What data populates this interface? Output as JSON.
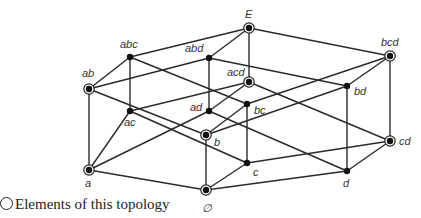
{
  "diagram": {
    "type": "hasse-diagram",
    "nodes": [
      {
        "id": "E",
        "label": "E",
        "x": 249,
        "y": 28,
        "in_topology": true,
        "lx": 245,
        "ly": 18
      },
      {
        "id": "abc",
        "label": "abc",
        "x": 130,
        "y": 57,
        "in_topology": false,
        "lx": 120,
        "ly": 48
      },
      {
        "id": "abd",
        "label": "abd",
        "x": 209,
        "y": 58,
        "in_topology": false,
        "lx": 185,
        "ly": 52
      },
      {
        "id": "bcd",
        "label": "bcd",
        "x": 390,
        "y": 56,
        "in_topology": true,
        "lx": 381,
        "ly": 46
      },
      {
        "id": "ab",
        "label": "ab",
        "x": 89,
        "y": 89,
        "in_topology": true,
        "lx": 82,
        "ly": 77
      },
      {
        "id": "acd",
        "label": "acd",
        "x": 249,
        "y": 82,
        "in_topology": true,
        "lx": 227,
        "ly": 76
      },
      {
        "id": "bd",
        "label": "bd",
        "x": 347,
        "y": 86,
        "in_topology": false,
        "lx": 354,
        "ly": 95
      },
      {
        "id": "ad",
        "label": "ad",
        "x": 209,
        "y": 111,
        "in_topology": false,
        "lx": 190,
        "ly": 111
      },
      {
        "id": "bc",
        "label": "bc",
        "x": 247,
        "y": 104,
        "in_topology": false,
        "lx": 254,
        "ly": 114
      },
      {
        "id": "ac",
        "label": "ac",
        "x": 130,
        "y": 111,
        "in_topology": false,
        "lx": 124,
        "ly": 126
      },
      {
        "id": "cd",
        "label": "cd",
        "x": 390,
        "y": 141,
        "in_topology": true,
        "lx": 399,
        "ly": 145
      },
      {
        "id": "a",
        "label": "a",
        "x": 89,
        "y": 170,
        "in_topology": true,
        "lx": 85,
        "ly": 187
      },
      {
        "id": "b",
        "label": "b",
        "x": 206,
        "y": 135,
        "in_topology": true,
        "lx": 214,
        "ly": 146
      },
      {
        "id": "d",
        "label": "d",
        "x": 347,
        "y": 171,
        "in_topology": false,
        "lx": 343,
        "ly": 187
      },
      {
        "id": "c",
        "label": "c",
        "x": 247,
        "y": 163,
        "in_topology": false,
        "lx": 253,
        "ly": 176
      },
      {
        "id": "empty",
        "label": "∅",
        "x": 206,
        "y": 190,
        "in_topology": true,
        "lx": 202,
        "ly": 212
      }
    ],
    "edges": [
      [
        "E",
        "abc"
      ],
      [
        "E",
        "abd"
      ],
      [
        "E",
        "acd"
      ],
      [
        "E",
        "bcd"
      ],
      [
        "abc",
        "ab"
      ],
      [
        "abc",
        "ac"
      ],
      [
        "abc",
        "bc"
      ],
      [
        "abd",
        "ab"
      ],
      [
        "abd",
        "ad"
      ],
      [
        "abd",
        "bd"
      ],
      [
        "acd",
        "ac"
      ],
      [
        "acd",
        "ad"
      ],
      [
        "acd",
        "cd"
      ],
      [
        "bcd",
        "bc"
      ],
      [
        "bcd",
        "bd"
      ],
      [
        "bcd",
        "cd"
      ],
      [
        "ab",
        "a"
      ],
      [
        "ab",
        "b"
      ],
      [
        "ac",
        "a"
      ],
      [
        "ac",
        "c"
      ],
      [
        "ad",
        "a"
      ],
      [
        "ad",
        "d"
      ],
      [
        "bc",
        "b"
      ],
      [
        "bc",
        "c"
      ],
      [
        "bd",
        "b"
      ],
      [
        "bd",
        "d"
      ],
      [
        "cd",
        "c"
      ],
      [
        "cd",
        "d"
      ],
      [
        "a",
        "empty"
      ],
      [
        "b",
        "empty"
      ],
      [
        "c",
        "empty"
      ],
      [
        "d",
        "empty"
      ]
    ]
  },
  "legend": {
    "symbol": "ring-icon",
    "text": "Elements of this topology"
  }
}
